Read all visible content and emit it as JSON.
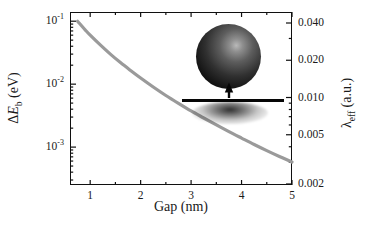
{
  "figure": {
    "background_color": "#ffffff",
    "frame_color": "#101010",
    "curve_color": "#9a9a9a"
  },
  "axes": {
    "x": {
      "label": "Gap (nm)",
      "ticks": [
        "1",
        "2",
        "3",
        "4",
        "5"
      ],
      "tick_values": [
        1,
        2,
        3,
        4,
        5
      ],
      "range": [
        0.6,
        5.0
      ],
      "scale": "linear"
    },
    "y_left": {
      "label_delta": "Δ",
      "label_e": "E",
      "label_sub": "b",
      "label_unit": " (eV)",
      "label_full": "ΔE_b (eV)",
      "scale": "log",
      "range": [
        0.00025,
        0.14
      ],
      "ticks": [
        {
          "mantissa": "10",
          "exponent": "-1",
          "value": 0.1
        },
        {
          "mantissa": "10",
          "exponent": "-2",
          "value": 0.01
        },
        {
          "mantissa": "10",
          "exponent": "-3",
          "value": 0.001
        }
      ]
    },
    "y_right": {
      "label_lambda": "λ",
      "label_sub": "eff",
      "label_unit": " (a.u.)",
      "label_full": "λ_eff (a.u.)",
      "scale": "log",
      "ticks": [
        {
          "text": "0.040",
          "value": 0.04
        },
        {
          "text": "0.020",
          "value": 0.02
        },
        {
          "text": "0.010",
          "value": 0.01
        },
        {
          "text": "0.005",
          "value": 0.005
        },
        {
          "text": "0.002",
          "value": 0.002
        }
      ]
    }
  },
  "inset": {
    "sphere_name": "nanoparticle-sphere",
    "bar_name": "substrate-bar",
    "arrow_name": "force-arrow-up",
    "shadow_name": "sphere-shadow"
  },
  "chart_data": {
    "type": "line",
    "title": "",
    "xlabel": "Gap (nm)",
    "ylabel": "ΔE_b (eV)",
    "y2label": "λ_eff (a.u.)",
    "xscale": "linear",
    "yscale": "log",
    "xlim": [
      0.6,
      5.0
    ],
    "ylim": [
      0.00025,
      0.14
    ],
    "y2lim": [
      0.0018,
      0.045
    ],
    "grid": false,
    "legend": null,
    "series": [
      {
        "name": "binding energy vs gap",
        "color": "#9a9a9a",
        "linewidth": 3.2,
        "x": [
          0.75,
          0.9,
          1.0,
          1.2,
          1.4,
          1.6,
          1.8,
          2.0,
          2.25,
          2.5,
          2.75,
          3.0,
          3.25,
          3.5,
          3.75,
          4.0,
          4.25,
          4.5,
          4.75,
          5.0
        ],
        "y": [
          0.1,
          0.073,
          0.06,
          0.042,
          0.03,
          0.022,
          0.0165,
          0.0125,
          0.009,
          0.0066,
          0.00495,
          0.00375,
          0.0029,
          0.00225,
          0.00176,
          0.00139,
          0.0011,
          0.00088,
          0.00071,
          0.00058
        ]
      }
    ]
  }
}
